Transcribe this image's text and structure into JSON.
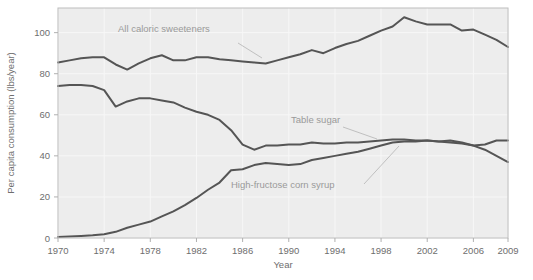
{
  "chart_data": {
    "type": "line",
    "title": "",
    "xlabel": "Year",
    "ylabel": "Per capita consumption (lbs/year)",
    "xlim": [
      1970,
      2009
    ],
    "ylim": [
      0,
      112
    ],
    "grid": true,
    "legend_position": "inline-annotations",
    "xticks": [
      1970,
      1974,
      1978,
      1982,
      1986,
      1990,
      1994,
      1998,
      2002,
      2006,
      2009
    ],
    "xtick_labels": [
      "1970",
      "1974",
      "1978",
      "1982",
      "1986",
      "1990",
      "1994",
      "1998",
      "2002",
      "2006",
      "2009"
    ],
    "yticks": [
      0,
      20,
      40,
      60,
      80,
      100
    ],
    "ytick_labels": [
      "0",
      "20",
      "40",
      "60",
      "80",
      "100"
    ],
    "x": [
      1970,
      1971,
      1972,
      1973,
      1974,
      1975,
      1976,
      1977,
      1978,
      1979,
      1980,
      1981,
      1982,
      1983,
      1984,
      1985,
      1986,
      1987,
      1988,
      1989,
      1990,
      1991,
      1992,
      1993,
      1994,
      1995,
      1996,
      1997,
      1998,
      1999,
      2000,
      2001,
      2002,
      2003,
      2004,
      2005,
      2006,
      2007,
      2008,
      2009
    ],
    "series": [
      {
        "name": "All caloric sweeteners",
        "color": "#555555",
        "values": [
          85.5,
          86.5,
          87.5,
          88.0,
          88.0,
          84.5,
          82.0,
          85.0,
          87.5,
          89.0,
          86.5,
          86.5,
          88.0,
          88.0,
          87.0,
          86.5,
          86.0,
          85.5,
          85.0,
          86.5,
          88.0,
          89.5,
          91.5,
          90.0,
          92.5,
          94.5,
          96.0,
          98.5,
          101.0,
          103.0,
          107.5,
          105.5,
          104.0,
          104.0,
          104.0,
          101.0,
          101.5,
          99.0,
          96.5,
          93.0
        ]
      },
      {
        "name": "Table sugar",
        "color": "#555555",
        "values": [
          74.0,
          74.5,
          74.5,
          74.0,
          72.0,
          64.0,
          66.5,
          68.0,
          68.0,
          67.0,
          66.0,
          63.5,
          61.5,
          60.0,
          57.5,
          52.5,
          45.5,
          43.0,
          45.0,
          45.0,
          45.5,
          45.5,
          46.5,
          46.0,
          46.0,
          46.5,
          46.5,
          47.0,
          47.5,
          48.0,
          48.0,
          47.5,
          47.5,
          47.0,
          46.5,
          46.0,
          45.0,
          45.5,
          47.5,
          47.5
        ]
      },
      {
        "name": "High-fructose corn syrup",
        "color": "#555555",
        "values": [
          0.5,
          0.7,
          1.0,
          1.3,
          1.8,
          3.0,
          5.0,
          6.5,
          8.0,
          10.5,
          13.0,
          16.0,
          19.5,
          23.5,
          27.0,
          33.0,
          33.5,
          35.5,
          36.5,
          36.0,
          35.5,
          36.0,
          38.0,
          39.0,
          40.0,
          41.0,
          42.0,
          43.5,
          45.0,
          46.5,
          47.0,
          47.0,
          47.5,
          47.0,
          47.5,
          46.5,
          45.0,
          43.0,
          40.0,
          37.0
        ]
      }
    ],
    "annotations": [
      {
        "text": "All caloric sweeteners",
        "series": "All caloric sweeteners"
      },
      {
        "text": "Table sugar",
        "series": "Table sugar"
      },
      {
        "text": "High-fructose corn syrup",
        "series": "High-fructose corn syrup"
      }
    ]
  }
}
